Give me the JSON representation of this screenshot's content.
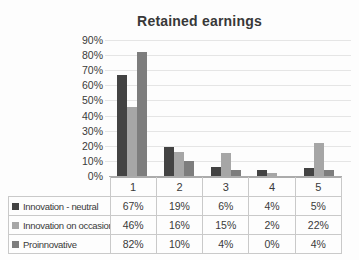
{
  "chart_data": {
    "type": "bar",
    "title": "Retained earnings",
    "categories": [
      "1",
      "2",
      "3",
      "4",
      "5"
    ],
    "series": [
      {
        "name": "Innovation - neutral",
        "color": "#434343",
        "values": [
          67,
          19,
          6,
          4,
          5
        ]
      },
      {
        "name": "Innovation on occasion",
        "color": "#a6a6a6",
        "values": [
          46,
          16,
          15,
          2,
          22
        ]
      },
      {
        "name": "Proinnovative",
        "color": "#7d7d7d",
        "values": [
          82,
          10,
          4,
          0,
          4
        ]
      }
    ],
    "value_suffix": "%",
    "ylim": [
      0,
      90
    ],
    "ytick_step": 10,
    "ytick_labels": [
      "90%",
      "80%",
      "70%",
      "60%",
      "50%",
      "40%",
      "30%",
      "20%",
      "10%",
      "0%"
    ],
    "grid": true,
    "legend_position": "data-table"
  },
  "colors": {
    "background": "#fdfdfd",
    "gridline": "#e5e5e5",
    "axis_line": "#ababab",
    "table_border": "#c9c9c9",
    "text": "#3a3a3a"
  }
}
